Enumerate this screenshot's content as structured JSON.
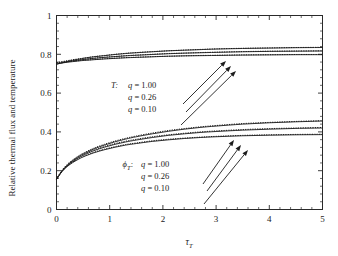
{
  "chart_data": {
    "type": "line",
    "title": "",
    "xlabel": "tau_T",
    "xlabel_base": "τ",
    "xlabel_sub": "T",
    "ylabel": "Relative thermal flux and temperature",
    "xlim": [
      0,
      5
    ],
    "ylim": [
      0,
      1
    ],
    "xticks": [
      0,
      1,
      2,
      3,
      4,
      5
    ],
    "xticklabels": [
      "0",
      "1",
      "2",
      "3",
      "4",
      "5"
    ],
    "yticks": [
      0,
      0.2,
      0.4,
      0.6,
      0.8,
      1
    ],
    "yticklabels": [
      "0",
      "0.2",
      "0.4",
      "0.6",
      "0.8",
      "1"
    ],
    "minor_ticks_per_interval": 4,
    "grid": false,
    "legend_position": "inside-left",
    "x": [
      0,
      0.1,
      0.2,
      0.3,
      0.4,
      0.5,
      0.7,
      0.9,
      1.1,
      1.3,
      1.5,
      1.8,
      2.1,
      2.4,
      2.7,
      3.0,
      3.5,
      4.0,
      4.5,
      5.0
    ],
    "series": [
      {
        "name": "T, q = 1.00",
        "group": "T",
        "q": 1.0,
        "style": "solid",
        "values": [
          0.748,
          0.756,
          0.763,
          0.769,
          0.774,
          0.779,
          0.787,
          0.793,
          0.799,
          0.804,
          0.808,
          0.813,
          0.818,
          0.821,
          0.824,
          0.827,
          0.83,
          0.832,
          0.834,
          0.835
        ]
      },
      {
        "name": "T, q = 1.00 (dotted)",
        "group": "T",
        "q": 1.0,
        "style": "dotted",
        "values": [
          0.757,
          0.762,
          0.767,
          0.772,
          0.776,
          0.78,
          0.788,
          0.794,
          0.8,
          0.805,
          0.809,
          0.814,
          0.818,
          0.822,
          0.825,
          0.828,
          0.831,
          0.833,
          0.835,
          0.836
        ]
      },
      {
        "name": "T, q = 0.26",
        "group": "T",
        "q": 0.26,
        "style": "solid",
        "values": [
          0.75,
          0.756,
          0.761,
          0.765,
          0.769,
          0.773,
          0.779,
          0.784,
          0.788,
          0.792,
          0.795,
          0.799,
          0.803,
          0.806,
          0.808,
          0.81,
          0.813,
          0.815,
          0.816,
          0.817
        ]
      },
      {
        "name": "T, q = 0.26 (dotted)",
        "group": "T",
        "q": 0.26,
        "style": "dotted",
        "values": [
          0.757,
          0.76,
          0.764,
          0.768,
          0.771,
          0.774,
          0.78,
          0.785,
          0.789,
          0.793,
          0.796,
          0.8,
          0.804,
          0.806,
          0.809,
          0.811,
          0.814,
          0.816,
          0.817,
          0.818
        ]
      },
      {
        "name": "T, q = 0.10",
        "group": "T",
        "q": 0.1,
        "style": "solid",
        "values": [
          0.751,
          0.755,
          0.759,
          0.762,
          0.765,
          0.768,
          0.772,
          0.776,
          0.779,
          0.782,
          0.784,
          0.787,
          0.79,
          0.792,
          0.793,
          0.794,
          0.796,
          0.797,
          0.798,
          0.798
        ]
      },
      {
        "name": "T, q = 0.10 (dotted)",
        "group": "T",
        "q": 0.1,
        "style": "dotted",
        "values": [
          0.757,
          0.759,
          0.762,
          0.765,
          0.767,
          0.769,
          0.773,
          0.777,
          0.78,
          0.783,
          0.785,
          0.788,
          0.79,
          0.792,
          0.794,
          0.795,
          0.797,
          0.798,
          0.799,
          0.799
        ]
      },
      {
        "name": "phi_T, q = 1.00",
        "group": "phi_T",
        "q": 1.0,
        "style": "solid",
        "values": [
          0.155,
          0.198,
          0.228,
          0.251,
          0.27,
          0.286,
          0.312,
          0.332,
          0.349,
          0.363,
          0.375,
          0.39,
          0.403,
          0.414,
          0.423,
          0.43,
          0.44,
          0.447,
          0.452,
          0.456
        ]
      },
      {
        "name": "phi_T, q = 1.00 (dotted)",
        "group": "phi_T",
        "q": 1.0,
        "style": "dotted",
        "values": [
          0.157,
          0.201,
          0.232,
          0.255,
          0.274,
          0.29,
          0.316,
          0.336,
          0.353,
          0.367,
          0.379,
          0.394,
          0.407,
          0.417,
          0.426,
          0.433,
          0.443,
          0.449,
          0.454,
          0.458
        ]
      },
      {
        "name": "phi_T, q = 0.26",
        "group": "phi_T",
        "q": 0.26,
        "style": "solid",
        "values": [
          0.155,
          0.196,
          0.225,
          0.246,
          0.264,
          0.279,
          0.303,
          0.321,
          0.336,
          0.348,
          0.358,
          0.371,
          0.382,
          0.39,
          0.397,
          0.402,
          0.409,
          0.414,
          0.418,
          0.42
        ]
      },
      {
        "name": "phi_T, q = 0.26 (dotted)",
        "group": "phi_T",
        "q": 0.26,
        "style": "dotted",
        "values": [
          0.157,
          0.199,
          0.228,
          0.25,
          0.268,
          0.283,
          0.307,
          0.325,
          0.34,
          0.352,
          0.362,
          0.375,
          0.385,
          0.393,
          0.4,
          0.405,
          0.412,
          0.417,
          0.42,
          0.423
        ]
      },
      {
        "name": "phi_T, q = 0.10",
        "group": "phi_T",
        "q": 0.1,
        "style": "solid",
        "values": [
          0.155,
          0.194,
          0.221,
          0.241,
          0.257,
          0.271,
          0.292,
          0.308,
          0.321,
          0.332,
          0.34,
          0.351,
          0.359,
          0.366,
          0.371,
          0.375,
          0.38,
          0.383,
          0.385,
          0.386
        ]
      },
      {
        "name": "phi_T, q = 0.10 (dotted)",
        "group": "phi_T",
        "q": 0.1,
        "style": "dotted",
        "values": [
          0.157,
          0.197,
          0.224,
          0.244,
          0.261,
          0.274,
          0.295,
          0.311,
          0.324,
          0.335,
          0.343,
          0.354,
          0.362,
          0.368,
          0.373,
          0.377,
          0.382,
          0.385,
          0.387,
          0.388
        ]
      }
    ],
    "annotations": [
      {
        "id": "legend-upper",
        "group_label": "T",
        "group_label_suffix": ":",
        "entries": [
          {
            "symbol": "q",
            "eq": "=",
            "value": "1.00"
          },
          {
            "symbol": "q",
            "eq": "=",
            "value": "0.26"
          },
          {
            "symbol": "q",
            "eq": "=",
            "value": "0.10"
          }
        ]
      },
      {
        "id": "legend-lower",
        "group_label": "ϕ",
        "group_label_sub": "T",
        "group_label_suffix": ":",
        "entries": [
          {
            "symbol": "q",
            "eq": "=",
            "value": "1.00"
          },
          {
            "symbol": "q",
            "eq": "=",
            "value": "0.26"
          },
          {
            "symbol": "q",
            "eq": "=",
            "value": "0.10"
          }
        ]
      }
    ]
  },
  "colors": {
    "axis": "#2a2a2a",
    "curve": "#1c1c1c",
    "background": "#ffffff"
  }
}
